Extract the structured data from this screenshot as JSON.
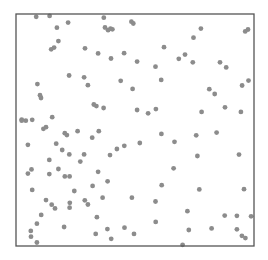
{
  "chart_data": {
    "type": "scatter",
    "title": "",
    "xlabel": "",
    "ylabel": "",
    "xlim": [
      0,
      1
    ],
    "ylim": [
      0,
      1
    ],
    "grid": false,
    "legend": null,
    "axes_ticks_visible": false,
    "frame": {
      "left": 16,
      "top": 14,
      "right": 254,
      "bottom": 246,
      "color": "#555555"
    },
    "marker": {
      "color": "#8c8c8c",
      "radius": 2.4
    },
    "series": [
      {
        "name": "points",
        "points": [
          [
            0.085,
            0.988
          ],
          [
            0.141,
            0.992
          ],
          [
            0.369,
            0.984
          ],
          [
            0.485,
            0.967
          ],
          [
            0.493,
            0.959
          ],
          [
            0.172,
            0.941
          ],
          [
            0.219,
            0.963
          ],
          [
            0.374,
            0.942
          ],
          [
            0.387,
            0.93
          ],
          [
            0.397,
            0.937
          ],
          [
            0.405,
            0.934
          ],
          [
            0.975,
            0.933
          ],
          [
            0.963,
            0.925
          ],
          [
            0.777,
            0.937
          ],
          [
            0.746,
            0.898
          ],
          [
            0.178,
            0.883
          ],
          [
            0.16,
            0.855
          ],
          [
            0.148,
            0.848
          ],
          [
            0.29,
            0.852
          ],
          [
            0.345,
            0.83
          ],
          [
            0.399,
            0.808
          ],
          [
            0.454,
            0.831
          ],
          [
            0.622,
            0.857
          ],
          [
            0.71,
            0.825
          ],
          [
            0.743,
            0.792
          ],
          [
            0.509,
            0.795
          ],
          [
            0.586,
            0.773
          ],
          [
            0.684,
            0.807
          ],
          [
            0.857,
            0.792
          ],
          [
            0.883,
            0.77
          ],
          [
            0.286,
            0.727
          ],
          [
            0.302,
            0.693
          ],
          [
            0.09,
            0.698
          ],
          [
            0.101,
            0.65
          ],
          [
            0.223,
            0.735
          ],
          [
            0.61,
            0.716
          ],
          [
            0.44,
            0.712
          ],
          [
            0.49,
            0.677
          ],
          [
            0.812,
            0.676
          ],
          [
            0.835,
            0.655
          ],
          [
            0.977,
            0.713
          ],
          [
            0.95,
            0.692
          ],
          [
            0.105,
            0.638
          ],
          [
            0.152,
            0.555
          ],
          [
            0.327,
            0.61
          ],
          [
            0.338,
            0.603
          ],
          [
            0.368,
            0.595
          ],
          [
            0.509,
            0.586
          ],
          [
            0.555,
            0.572
          ],
          [
            0.588,
            0.59
          ],
          [
            0.78,
            0.578
          ],
          [
            0.878,
            0.598
          ],
          [
            0.945,
            0.578
          ],
          [
            0.041,
            0.54
          ],
          [
            0.068,
            0.544
          ],
          [
            0.115,
            0.505
          ],
          [
            0.126,
            0.512
          ],
          [
            0.205,
            0.486
          ],
          [
            0.214,
            0.478
          ],
          [
            0.259,
            0.495
          ],
          [
            0.348,
            0.495
          ],
          [
            0.32,
            0.467
          ],
          [
            0.455,
            0.432
          ],
          [
            0.52,
            0.444
          ],
          [
            0.611,
            0.483
          ],
          [
            0.666,
            0.449
          ],
          [
            0.757,
            0.477
          ],
          [
            0.843,
            0.489
          ],
          [
            0.024,
            0.545
          ],
          [
            0.024,
            0.54
          ],
          [
            0.05,
            0.436
          ],
          [
            0.169,
            0.441
          ],
          [
            0.194,
            0.414
          ],
          [
            0.224,
            0.395
          ],
          [
            0.286,
            0.395
          ],
          [
            0.395,
            0.392
          ],
          [
            0.424,
            0.418
          ],
          [
            0.662,
            0.335
          ],
          [
            0.762,
            0.388
          ],
          [
            0.937,
            0.394
          ],
          [
            0.065,
            0.33
          ],
          [
            0.14,
            0.371
          ],
          [
            0.178,
            0.332
          ],
          [
            0.27,
            0.364
          ],
          [
            0.345,
            0.32
          ],
          [
            0.05,
            0.312
          ],
          [
            0.14,
            0.31
          ],
          [
            0.205,
            0.3
          ],
          [
            0.225,
            0.3
          ],
          [
            0.322,
            0.259
          ],
          [
            0.385,
            0.279
          ],
          [
            0.612,
            0.262
          ],
          [
            0.77,
            0.244
          ],
          [
            0.958,
            0.245
          ],
          [
            0.068,
            0.242
          ],
          [
            0.126,
            0.198
          ],
          [
            0.15,
            0.178
          ],
          [
            0.164,
            0.162
          ],
          [
            0.225,
            0.165
          ],
          [
            0.226,
            0.186
          ],
          [
            0.245,
            0.237
          ],
          [
            0.289,
            0.197
          ],
          [
            0.302,
            0.179
          ],
          [
            0.34,
            0.124
          ],
          [
            0.364,
            0.208
          ],
          [
            0.487,
            0.208
          ],
          [
            0.586,
            0.192
          ],
          [
            0.72,
            0.15
          ],
          [
            0.877,
            0.131
          ],
          [
            0.928,
            0.13
          ],
          [
            0.988,
            0.128
          ],
          [
            0.106,
            0.134
          ],
          [
            0.088,
            0.096
          ],
          [
            0.202,
            0.082
          ],
          [
            0.062,
            0.065
          ],
          [
            0.335,
            0.052
          ],
          [
            0.384,
            0.073
          ],
          [
            0.456,
            0.079
          ],
          [
            0.496,
            0.052
          ],
          [
            0.587,
            0.104
          ],
          [
            0.088,
            0.015
          ],
          [
            0.4,
            0.031
          ],
          [
            0.726,
            0.069
          ],
          [
            0.822,
            0.076
          ],
          [
            0.928,
            0.072
          ],
          [
            0.949,
            0.044
          ],
          [
            0.964,
            0.034
          ],
          [
            0.7,
            0.005
          ],
          [
            0.063,
            0.04
          ]
        ]
      }
    ]
  }
}
